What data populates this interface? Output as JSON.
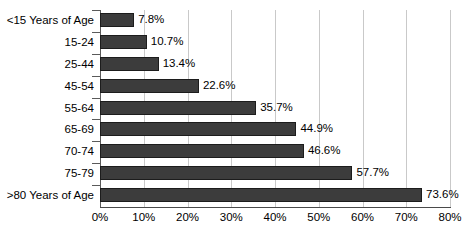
{
  "chart_data": {
    "type": "bar",
    "orientation": "horizontal",
    "title": "",
    "subtitle": "",
    "xlabel": "",
    "ylabel": "",
    "xlim": [
      0,
      80
    ],
    "grid": true,
    "legend": false,
    "legend_position": "none",
    "categories": [
      "<15 Years of Age",
      "15-24",
      "25-44",
      "45-54",
      "55-64",
      "65-69",
      "70-74",
      "75-79",
      ">80 Years of Age"
    ],
    "values": [
      7.8,
      10.7,
      13.4,
      22.6,
      35.7,
      44.9,
      46.6,
      57.7,
      73.6
    ],
    "data_labels": [
      "7.8%",
      "10.7%",
      "13.4%",
      "22.6%",
      "35.7%",
      "44.9%",
      "46.6%",
      "57.7%",
      "73.6%"
    ],
    "xticks": [
      0,
      10,
      20,
      30,
      40,
      50,
      60,
      70,
      80
    ],
    "xtick_labels": [
      "0%",
      "10%",
      "20%",
      "30%",
      "40%",
      "50%",
      "60%",
      "70%",
      "80%"
    ],
    "colors": {
      "bar_fill": "#3c3c3c",
      "bar_outline": "#1c1c1c",
      "gridline": "#c9c9c9",
      "axis": "#4a4a4a",
      "text": "#000000",
      "background": "#ffffff"
    }
  }
}
